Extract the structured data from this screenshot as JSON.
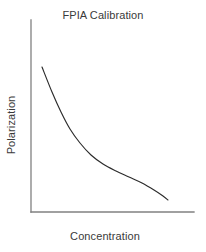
{
  "figure": {
    "width": 206,
    "height": 252,
    "background_color": "#ffffff"
  },
  "chart_data": {
    "type": "line",
    "title": "FPIA Calibration",
    "xlabel": "Concentration",
    "ylabel": "Polarization",
    "grid": false,
    "legend": null,
    "axis_color": "#808080",
    "line_color": "#2b2b2b",
    "xticks": [],
    "yticks": [],
    "xlim": [
      0,
      1
    ],
    "ylim": [
      0,
      1
    ],
    "series": [
      {
        "name": "calibration-curve",
        "x": [
          0.07,
          0.12,
          0.18,
          0.24,
          0.31,
          0.39,
          0.48,
          0.58,
          0.68,
          0.78,
          0.88,
          0.95,
          1.0
        ],
        "y": [
          0.75,
          0.64,
          0.53,
          0.45,
          0.38,
          0.32,
          0.28,
          0.24,
          0.21,
          0.18,
          0.14,
          0.1,
          0.07
        ]
      }
    ],
    "path_points_px": [
      [
        42,
        67
      ],
      [
        52,
        92
      ],
      [
        61,
        112
      ],
      [
        70,
        129
      ],
      [
        80,
        143
      ],
      [
        91,
        155
      ],
      [
        103,
        164
      ],
      [
        116,
        171
      ],
      [
        129,
        177
      ],
      [
        142,
        183
      ],
      [
        154,
        190
      ],
      [
        163,
        196
      ],
      [
        168,
        200
      ]
    ],
    "axes_px": {
      "y_axis_x": 31,
      "y_axis_top": 20,
      "y_axis_bottom": 212,
      "x_axis_y": 212,
      "x_axis_left": 31,
      "x_axis_right": 194
    }
  }
}
